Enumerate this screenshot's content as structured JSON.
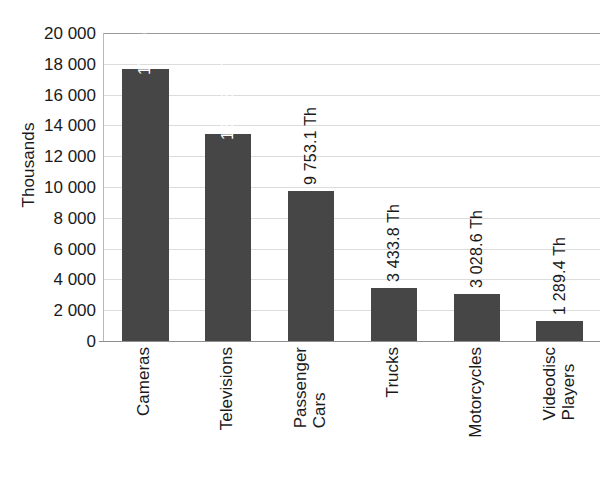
{
  "chart_data": {
    "type": "bar",
    "title": "",
    "subtitle": "",
    "xlabel": "",
    "ylabel": "Thousands",
    "ylim": [
      0,
      20000
    ],
    "ytick_step": 2000,
    "grid": true,
    "legend": null,
    "orientation": "vertical",
    "bar_color": "#464646",
    "gridline_color": "#dcdcdc",
    "categories": [
      "Cameras",
      "Televisions",
      "Passenger Cars",
      "Trucks",
      "Motorcycles",
      "Videodisc Players"
    ],
    "category_label_lines": [
      [
        "Cameras"
      ],
      [
        "Televisions"
      ],
      [
        "Passenger",
        "Cars"
      ],
      [
        "Trucks"
      ],
      [
        "Motorcycles"
      ],
      [
        "Videodisc",
        "Players"
      ]
    ],
    "values": [
      17656.0,
      13438.0,
      9753.1,
      3433.8,
      3028.6,
      1289.4
    ],
    "data_labels": [
      "17 656.0 Th",
      "13 438.0 Th",
      "9 753.1 Th",
      "3 433.8 Th",
      "3 028.6 Th",
      "1 289.4 Th"
    ],
    "data_label_placement": [
      "inside",
      "inside",
      "outside",
      "outside",
      "outside",
      "outside"
    ],
    "ytick_labels": [
      "20 000",
      "18 000",
      "16 000",
      "14 000",
      "12 000",
      "10 000",
      "8 000",
      "6 000",
      "4 000",
      "2 000",
      "0"
    ],
    "ytick_values": [
      20000,
      18000,
      16000,
      14000,
      12000,
      10000,
      8000,
      6000,
      4000,
      2000,
      0
    ]
  }
}
